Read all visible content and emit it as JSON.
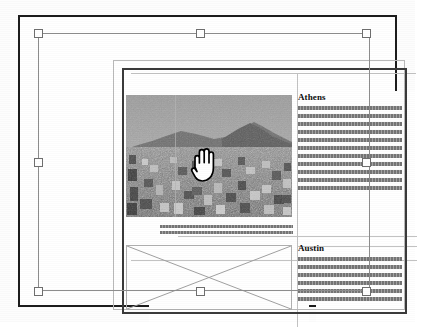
{
  "app": {
    "view_name": "page-layout-canvas",
    "cursor": "open-hand-grab-cursor"
  },
  "document": {
    "page_label": "",
    "articles": [
      {
        "heading": "Athens",
        "body_lines": 11,
        "column": "right"
      },
      {
        "heading": "Austin",
        "body_lines": 6,
        "column": "right"
      }
    ],
    "image_frame": {
      "name": "athens-cityscape-photo",
      "alt": "Grayscale photograph of Athens cityscape with hills",
      "selected": true
    },
    "empty_frame": {
      "name": "empty-picture-frame",
      "marker": "x-cross"
    },
    "caption_lines": 2
  },
  "selection": {
    "handle_count": 8,
    "handles": [
      {
        "name": "handle-top-left",
        "x": 38,
        "y": 33
      },
      {
        "name": "handle-top-center",
        "x": 200,
        "y": 33
      },
      {
        "name": "handle-top-right",
        "x": 366,
        "y": 33
      },
      {
        "name": "handle-middle-left",
        "x": 38,
        "y": 162
      },
      {
        "name": "handle-middle-right",
        "x": 366,
        "y": 162
      },
      {
        "name": "handle-bottom-left",
        "x": 38,
        "y": 291
      },
      {
        "name": "handle-bottom-center",
        "x": 200,
        "y": 291
      },
      {
        "name": "handle-bottom-right",
        "x": 366,
        "y": 291
      }
    ]
  },
  "colors": {
    "page_border": "#1c1c1c",
    "frame_outer": "#b9b9b9",
    "frame_inner": "#3a3a3a",
    "selection_line": "#8d8d8d",
    "handle_fill": "#ffffff",
    "handle_border": "#6f6f6f",
    "greek_text": "#6e6e6e",
    "heading_text": "#0d0d0d",
    "canvas_bg": "#fdfdfd",
    "page_bg": "#ffffff"
  }
}
